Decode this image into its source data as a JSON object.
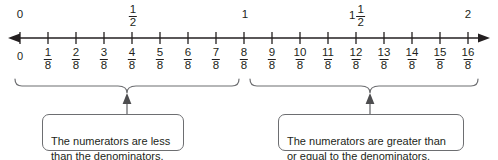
{
  "figure": {
    "line_color": "#231f20",
    "box_border_color": "#6d6e71",
    "text_color": "#231f20"
  },
  "number_line": {
    "start_value": 0,
    "end_value": 2,
    "denominator": 8,
    "tick_count": 17,
    "top_labels": [
      {
        "text": "0",
        "value": 0,
        "type": "whole"
      },
      {
        "text": "1/2",
        "numerator": "1",
        "denominator": "2",
        "value": 0.5,
        "type": "fraction"
      },
      {
        "text": "1",
        "value": 1,
        "type": "whole"
      },
      {
        "text": "1 1/2",
        "whole": "1",
        "numerator": "1",
        "denominator": "2",
        "value": 1.5,
        "type": "mixed"
      },
      {
        "text": "2",
        "value": 2,
        "type": "whole"
      }
    ],
    "bottom_labels": [
      {
        "text": "0",
        "numerator": "0",
        "denominator": "8",
        "type": "whole"
      },
      {
        "text": "1/8",
        "numerator": "1",
        "denominator": "8",
        "type": "fraction"
      },
      {
        "text": "2/8",
        "numerator": "2",
        "denominator": "8",
        "type": "fraction"
      },
      {
        "text": "3/8",
        "numerator": "3",
        "denominator": "8",
        "type": "fraction"
      },
      {
        "text": "4/8",
        "numerator": "4",
        "denominator": "8",
        "type": "fraction"
      },
      {
        "text": "5/8",
        "numerator": "5",
        "denominator": "8",
        "type": "fraction"
      },
      {
        "text": "6/8",
        "numerator": "6",
        "denominator": "8",
        "type": "fraction"
      },
      {
        "text": "7/8",
        "numerator": "7",
        "denominator": "8",
        "type": "fraction"
      },
      {
        "text": "8/8",
        "numerator": "8",
        "denominator": "8",
        "type": "fraction"
      },
      {
        "text": "9/8",
        "numerator": "9",
        "denominator": "8",
        "type": "fraction"
      },
      {
        "text": "10/8",
        "numerator": "10",
        "denominator": "8",
        "type": "fraction"
      },
      {
        "text": "11/8",
        "numerator": "11",
        "denominator": "8",
        "type": "fraction"
      },
      {
        "text": "12/8",
        "numerator": "12",
        "denominator": "8",
        "type": "fraction"
      },
      {
        "text": "13/8",
        "numerator": "13",
        "denominator": "8",
        "type": "fraction"
      },
      {
        "text": "14/8",
        "numerator": "14",
        "denominator": "8",
        "type": "fraction"
      },
      {
        "text": "15/8",
        "numerator": "15",
        "denominator": "8",
        "type": "fraction"
      },
      {
        "text": "16/8",
        "numerator": "16",
        "denominator": "8",
        "type": "fraction"
      }
    ]
  },
  "callouts": {
    "left": {
      "text": "The numerators are less than the denominators.",
      "covers": "0/8 to 7/8"
    },
    "right": {
      "text": "The numerators are greater than or equal to the denominators.",
      "covers": "8/8 to 16/8"
    }
  }
}
